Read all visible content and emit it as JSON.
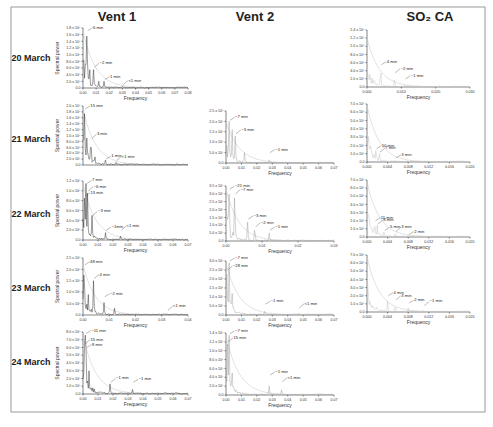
{
  "figure": {
    "columns": [
      "Vent 1",
      "Vent 2",
      "SO₂ CA"
    ],
    "rows": [
      "20 March",
      "21 March",
      "22 March",
      "23 March",
      "24 March"
    ],
    "ylabel": "Spectral power",
    "xlabel": "Frequency"
  },
  "chart_data": [
    {
      "type": "line",
      "column": "Vent 1",
      "row": "20 March",
      "xlabel": "Frequency",
      "ylabel": "Spectral power",
      "xlim": [
        0,
        0.08
      ],
      "xticks": [
        "0.00",
        "0.01",
        "0.02",
        "0.03",
        "0.04",
        "0.05",
        "0.06",
        "0.07",
        "0.08"
      ],
      "ylim": [
        0,
        1.8
      ],
      "yticks": [
        "0.0",
        "2.0 x 10⁵",
        "4.0 x 10⁵",
        "6.0 x 10⁵",
        "8.0 x 10⁵",
        "1.0 x 10⁶",
        "1.2 x 10⁶",
        "1.4 x 10⁶",
        "1.6 x 10⁶",
        "1.8 x 10⁶"
      ],
      "style": "dark",
      "annotations": [
        {
          "text": "6 min",
          "x": 0.003,
          "y": 1.72
        },
        {
          "text": "~2 min",
          "x": 0.008,
          "y": 0.62
        },
        {
          "text": "1 min",
          "x": 0.016,
          "y": 0.25
        },
        {
          "text": "<1 min",
          "x": 0.03,
          "y": 0.1
        }
      ],
      "peaks": [
        [
          0.003,
          1.7
        ],
        [
          0.002,
          1.0
        ],
        [
          0.005,
          0.6
        ],
        [
          0.008,
          0.55
        ],
        [
          0.012,
          0.2
        ],
        [
          0.016,
          0.2
        ],
        [
          0.03,
          0.06
        ]
      ]
    },
    {
      "type": "line",
      "column": "Vent 1",
      "row": "21 March",
      "xlabel": "Frequency",
      "ylabel": "Spectral power",
      "xlim": [
        0,
        0.08
      ],
      "xticks": [],
      "ylim": [
        0,
        2.0
      ],
      "yticks": [
        "0.0",
        "2.0 x 10⁵",
        "4.0 x 10⁵",
        "6.0 x 10⁵",
        "8.0 x 10⁵",
        "1.0 x 10⁶",
        "1.2 x 10⁶",
        "1.4 x 10⁶",
        "1.6 x 10⁶",
        "1.8 x 10⁶",
        "2.0 x 10⁶"
      ],
      "style": "dark",
      "annotations": [
        {
          "text": "15 min",
          "x": 0.001,
          "y": 1.9
        },
        {
          "text": "3 min",
          "x": 0.006,
          "y": 0.9
        },
        {
          "text": "1 min",
          "x": 0.017,
          "y": 0.2
        },
        {
          "text": "<1 min",
          "x": 0.025,
          "y": 0.15
        }
      ],
      "peaks": [
        [
          0.001,
          1.9
        ],
        [
          0.003,
          1.0
        ],
        [
          0.006,
          0.85
        ],
        [
          0.009,
          0.3
        ],
        [
          0.017,
          0.18
        ],
        [
          0.025,
          0.1
        ]
      ]
    },
    {
      "type": "line",
      "column": "Vent 1",
      "row": "22 March",
      "xlabel": "Frequency",
      "ylabel": "Spectral power",
      "xlim": [
        0,
        0.07
      ],
      "xticks": [
        "0.00",
        "0.01",
        "0.02",
        "0.03",
        "0.04",
        "0.05",
        "0.06",
        "0.07"
      ],
      "ylim": [
        0,
        1.2
      ],
      "yticks": [
        "0.0",
        "2.0 x 10⁵",
        "4.0 x 10⁵",
        "6.0 x 10⁵",
        "8.0 x 10⁵",
        "1.0 x 10⁶",
        "1.2 x 10⁶"
      ],
      "style": "dark",
      "annotations": [
        {
          "text": "7 min",
          "x": 0.002,
          "y": 1.15
        },
        {
          "text": "~6 min",
          "x": 0.003,
          "y": 1.0
        },
        {
          "text": "13 min",
          "x": 0.001,
          "y": 0.9
        },
        {
          "text": "~3 min",
          "x": 0.006,
          "y": 0.5
        },
        {
          "text": "~1min",
          "x": 0.015,
          "y": 0.2
        },
        {
          "text": "<1 min",
          "x": 0.025,
          "y": 0.2
        }
      ],
      "peaks": [
        [
          0.002,
          1.15
        ],
        [
          0.003,
          0.95
        ],
        [
          0.001,
          0.85
        ],
        [
          0.006,
          0.5
        ],
        [
          0.015,
          0.15
        ],
        [
          0.025,
          0.08
        ]
      ]
    },
    {
      "type": "line",
      "column": "Vent 1",
      "row": "23 March",
      "xlabel": "Frequency",
      "ylabel": "Spectral power",
      "xlim": [
        0,
        0.04
      ],
      "xticks": [
        "0.00",
        "0.01",
        "0.02",
        "0.03",
        "0.04"
      ],
      "ylim": [
        0,
        2.5
      ],
      "yticks": [
        "0.0",
        "5.0 x 10⁵",
        "1.0 x 10⁶",
        "1.5 x 10⁶",
        "2.0 x 10⁶",
        "2.5 x 10⁶"
      ],
      "style": "dark",
      "annotations": [
        {
          "text": "48 min",
          "x": 0.0004,
          "y": 2.2
        },
        {
          "text": "4 min",
          "x": 0.004,
          "y": 1.6
        },
        {
          "text": "~2 min",
          "x": 0.008,
          "y": 0.8
        },
        {
          "text": "<1 min",
          "x": 0.032,
          "y": 0.2
        }
      ],
      "peaks": [
        [
          0.0004,
          2.2
        ],
        [
          0.004,
          1.5
        ],
        [
          0.002,
          0.9
        ],
        [
          0.008,
          0.55
        ],
        [
          0.012,
          0.3
        ],
        [
          0.032,
          0.05
        ]
      ]
    },
    {
      "type": "line",
      "column": "Vent 1",
      "row": "24 March",
      "xlabel": "Frequency",
      "ylabel": "Spectral power",
      "xlim": [
        0,
        0.07
      ],
      "xticks": [
        "0.00",
        "0.01",
        "0.02",
        "0.03",
        "0.04",
        "0.05",
        "0.06",
        "0.07"
      ],
      "ylim": [
        0,
        8.0
      ],
      "yticks": [
        "0.0",
        "1.0 x 10⁵",
        "2.0 x 10⁵",
        "3.0 x 10⁵",
        "4.0 x 10⁵",
        "5.0 x 10⁵",
        "6.0 x 10⁵",
        "7.0 x 10⁵",
        "8.0 x 10⁵"
      ],
      "style": "dark",
      "annotations": [
        {
          "text": "~11 min",
          "x": 0.0015,
          "y": 7.8
        },
        {
          "text": "15 min",
          "x": 0.001,
          "y": 6.5
        },
        {
          "text": "8 min",
          "x": 0.002,
          "y": 6.0
        },
        {
          "text": "~1 min",
          "x": 0.018,
          "y": 1.5
        },
        {
          "text": "~1 min",
          "x": 0.033,
          "y": 1.5
        }
      ],
      "peaks": [
        [
          0.0015,
          7.6
        ],
        [
          0.001,
          6.3
        ],
        [
          0.002,
          5.9
        ],
        [
          0.004,
          3.0
        ],
        [
          0.018,
          1.3
        ],
        [
          0.033,
          0.6
        ]
      ]
    },
    {
      "type": "line",
      "column": "Vent 2",
      "row": "21 March",
      "xlabel": "Frequency",
      "ylabel": "Spectral power",
      "xlim": [
        0,
        0.07
      ],
      "xticks": [
        "0.00",
        "0.01",
        "0.02",
        "0.03",
        "0.04",
        "0.05",
        "0.06",
        "0.07"
      ],
      "ylim": [
        0,
        2.5
      ],
      "yticks": [
        "0.0",
        "5.0 x 10⁵",
        "1.0 x 10⁶",
        "1.5 x 10⁶",
        "2.0 x 10⁶",
        "2.5 x 10⁶"
      ],
      "style": "grey",
      "annotations": [
        {
          "text": "~7 min",
          "x": 0.002,
          "y": 2.05
        },
        {
          "text": "~3 min",
          "x": 0.006,
          "y": 1.4
        },
        {
          "text": "~1 min",
          "x": 0.028,
          "y": 0.5
        }
      ],
      "peaks": [
        [
          0.002,
          2.0
        ],
        [
          0.004,
          1.6
        ],
        [
          0.006,
          1.3
        ],
        [
          0.012,
          0.5
        ],
        [
          0.028,
          0.15
        ]
      ]
    },
    {
      "type": "line",
      "column": "Vent 2",
      "row": "22 March",
      "xlabel": "Frequency",
      "ylabel": "Spectral power",
      "xlim": [
        0,
        0.03
      ],
      "xticks": [
        "0.00",
        "0.01",
        "0.02",
        "0.03"
      ],
      "ylim": [
        0,
        3.5
      ],
      "yticks": [
        "0.0",
        "5.0 x 10⁵",
        "1.0 x 10⁶",
        "1.5 x 10⁶",
        "2.0 x 10⁶",
        "2.5 x 10⁶",
        "3.0 x 10⁶",
        "3.5 x 10⁶"
      ],
      "style": "grey",
      "annotations": [
        {
          "text": "~21 min",
          "x": 0.0008,
          "y": 3.3
        },
        {
          "text": "~7 min",
          "x": 0.0024,
          "y": 3.0
        },
        {
          "text": "~3 min",
          "x": 0.006,
          "y": 1.4
        },
        {
          "text": "~2 min",
          "x": 0.008,
          "y": 0.9
        },
        {
          "text": "~1 min",
          "x": 0.012,
          "y": 0.7
        }
      ],
      "peaks": [
        [
          0.0008,
          3.3
        ],
        [
          0.0024,
          2.9
        ],
        [
          0.001,
          1.2
        ],
        [
          0.006,
          1.2
        ],
        [
          0.008,
          0.8
        ],
        [
          0.012,
          0.5
        ]
      ]
    },
    {
      "type": "line",
      "column": "Vent 2",
      "row": "23 March",
      "xlabel": "Frequency",
      "ylabel": "Spectral power",
      "xlim": [
        0,
        0.07
      ],
      "xticks": [
        "0.00",
        "0.01",
        "0.02",
        "0.03",
        "0.04",
        "0.05",
        "0.06",
        "0.07"
      ],
      "ylim": [
        0,
        3.0
      ],
      "yticks": [
        "0.0",
        "5.0 x 10⁵",
        "1.0 x 10⁶",
        "1.5 x 10⁶",
        "2.0 x 10⁶",
        "2.5 x 10⁶",
        "3.0 x 10⁶"
      ],
      "style": "grey",
      "annotations": [
        {
          "text": "~7 min",
          "x": 0.002,
          "y": 3.0
        },
        {
          "text": "~28 min",
          "x": 0.0006,
          "y": 2.5
        },
        {
          "text": "~1 min",
          "x": 0.025,
          "y": 0.6
        },
        {
          "text": "<1 min",
          "x": 0.047,
          "y": 0.4
        }
      ],
      "peaks": [
        [
          0.002,
          2.9
        ],
        [
          0.0006,
          2.4
        ],
        [
          0.004,
          1.2
        ],
        [
          0.025,
          0.2
        ],
        [
          0.047,
          0.1
        ]
      ]
    },
    {
      "type": "line",
      "column": "Vent 2",
      "row": "24 March",
      "xlabel": "Frequency",
      "ylabel": "Spectral power",
      "xlim": [
        0,
        0.07
      ],
      "xticks": [
        "0.00",
        "0.01",
        "0.02",
        "0.03",
        "0.04",
        "0.05",
        "0.06",
        "0.07"
      ],
      "ylim": [
        0,
        1.4
      ],
      "yticks": [
        "0.0",
        "2.0 x 10⁵",
        "4.0 x 10⁵",
        "6.0 x 10⁵",
        "8.0 x 10⁵",
        "1.0 x 10⁶",
        "1.2 x 10⁶",
        "1.4 x 10⁶"
      ],
      "style": "grey",
      "annotations": [
        {
          "text": "~7 min",
          "x": 0.002,
          "y": 1.38
        },
        {
          "text": "15 min",
          "x": 0.001,
          "y": 1.2
        },
        {
          "text": "~1 min",
          "x": 0.028,
          "y": 0.45
        },
        {
          "text": "<1 min",
          "x": 0.036,
          "y": 0.3
        }
      ],
      "peaks": [
        [
          0.002,
          1.35
        ],
        [
          0.001,
          1.15
        ],
        [
          0.004,
          0.5
        ],
        [
          0.028,
          0.2
        ],
        [
          0.036,
          0.12
        ]
      ]
    },
    {
      "type": "line",
      "column": "SO₂ CA",
      "row": "20 March",
      "xlabel": "Frequency",
      "ylabel": "Spectral power",
      "xlim": [
        0,
        0.03
      ],
      "xticks": [
        "0.000",
        "0.010",
        "0.020",
        "0.030"
      ],
      "ylim": [
        0,
        1.4
      ],
      "yticks": [
        "0.0",
        "2.0 x 10⁵",
        "4.0 x 10⁵",
        "6.0 x 10⁵",
        "8.0 x 10⁵",
        "1.0 x 10⁶",
        "1.2 x 10⁶",
        "1.4 x 10⁶"
      ],
      "style": "light",
      "annotations": [
        {
          "text": "4 min",
          "x": 0.004,
          "y": 0.55
        },
        {
          "text": "~2 min",
          "x": 0.008,
          "y": 0.35
        },
        {
          "text": "~1 min",
          "x": 0.011,
          "y": 0.2
        }
      ],
      "peaks": [
        [
          0.0,
          1.2
        ],
        [
          0.004,
          0.4
        ],
        [
          0.008,
          0.2
        ],
        [
          0.011,
          0.05
        ]
      ]
    },
    {
      "type": "line",
      "column": "SO₂ CA",
      "row": "21 March",
      "xlabel": "Frequency",
      "ylabel": "Spectral power",
      "xlim": [
        0,
        0.02
      ],
      "xticks": [
        "0.000",
        "0.004",
        "0.008",
        "0.012",
        "0.016",
        "0.020"
      ],
      "ylim": [
        0,
        7.0
      ],
      "yticks": [
        "0.0",
        "1.0 x 10⁶",
        "2.0 x 10⁶",
        "3.0 x 10⁶",
        "4.0 x 10⁶",
        "5.0 x 10⁶",
        "6.0 x 10⁶",
        "7.0 x 10⁶"
      ],
      "style": "light",
      "annotations": [
        {
          "text": "10 min",
          "x": 0.0017,
          "y": 1.6
        },
        {
          "text": "7 min",
          "x": 0.0024,
          "y": 1.2
        },
        {
          "text": "3 min",
          "x": 0.0055,
          "y": 0.5
        }
      ],
      "peaks": [
        [
          0.0,
          6.8
        ],
        [
          0.0017,
          1.4
        ],
        [
          0.0024,
          1.1
        ],
        [
          0.0055,
          0.3
        ]
      ]
    },
    {
      "type": "line",
      "column": "SO₂ CA",
      "row": "22 March",
      "xlabel": "Frequency",
      "ylabel": "Spectral power",
      "xlim": [
        0,
        0.02
      ],
      "xticks": [
        "0.000",
        "0.004",
        "0.008",
        "0.012",
        "0.016",
        "0.020"
      ],
      "ylim": [
        0,
        7.0
      ],
      "yticks": [
        "0.0",
        "1.0 x 10⁶",
        "2.0 x 10⁶",
        "3.0 x 10⁶",
        "4.0 x 10⁶",
        "5.0 x 10⁶",
        "6.0 x 10⁶",
        "7.0 x 10⁶"
      ],
      "style": "light",
      "annotations": [
        {
          "text": "11 min",
          "x": 0.0015,
          "y": 2.0
        },
        {
          "text": "8 min",
          "x": 0.002,
          "y": 1.6
        },
        {
          "text": "5 min",
          "x": 0.0033,
          "y": 0.8
        },
        {
          "text": "3 min",
          "x": 0.0055,
          "y": 0.7
        },
        {
          "text": "2 min",
          "x": 0.008,
          "y": 0.3
        }
      ],
      "peaks": [
        [
          0.0,
          6.8
        ],
        [
          0.0015,
          1.8
        ],
        [
          0.002,
          1.5
        ],
        [
          0.0033,
          0.6
        ],
        [
          0.0055,
          0.5
        ],
        [
          0.008,
          0.15
        ]
      ]
    },
    {
      "type": "line",
      "column": "SO₂ CA",
      "row": "23 March",
      "xlabel": "Frequency",
      "ylabel": "Spectral power",
      "xlim": [
        0,
        0.02
      ],
      "xticks": [
        "0.000",
        "0.004",
        "0.008",
        "0.012",
        "0.016",
        "0.020"
      ],
      "ylim": [
        0,
        7.0
      ],
      "yticks": [
        "0.0",
        "1.0 x 10⁶",
        "2.0 x 10⁶",
        "3.0 x 10⁶",
        "4.0 x 10⁶",
        "5.0 x 10⁶",
        "6.0 x 10⁶",
        "7.0 x 10⁶"
      ],
      "style": "light",
      "annotations": [
        {
          "text": "4 min",
          "x": 0.004,
          "y": 2.0
        },
        {
          "text": "3 min",
          "x": 0.0055,
          "y": 1.5
        },
        {
          "text": "2 min",
          "x": 0.008,
          "y": 1.1
        },
        {
          "text": "~1 min",
          "x": 0.011,
          "y": 0.8
        }
      ],
      "peaks": [
        [
          0.0,
          6.8
        ],
        [
          0.004,
          1.3
        ],
        [
          0.0055,
          0.8
        ],
        [
          0.008,
          0.5
        ],
        [
          0.011,
          0.2
        ]
      ]
    }
  ]
}
